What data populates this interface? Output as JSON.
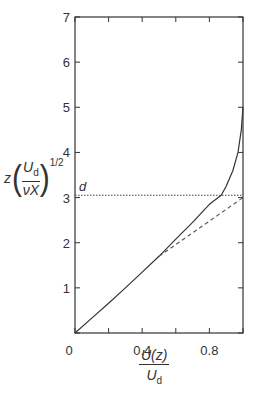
{
  "chart_data": {
    "type": "line",
    "title": "",
    "xlabel": "U(z) / U_d",
    "ylabel": "z (U_d / νX)^(1/2)",
    "xlim": [
      0,
      1.0
    ],
    "ylim": [
      0,
      7
    ],
    "x_ticks": [
      0,
      0.2,
      0.4,
      0.6,
      0.8,
      1.0
    ],
    "x_tick_labels": [
      "0",
      "",
      "0.4",
      "",
      "0.8",
      ""
    ],
    "y_ticks": [
      0,
      1,
      2,
      3,
      4,
      5,
      6,
      7
    ],
    "y_tick_labels": [
      "",
      "1",
      "2",
      "3",
      "4",
      "5",
      "6",
      "7"
    ],
    "grid": false,
    "legend": null,
    "series": [
      {
        "name": "velocity profile",
        "style": "solid",
        "points": [
          [
            0,
            0
          ],
          [
            0.1,
            0.33
          ],
          [
            0.2,
            0.66
          ],
          [
            0.3,
            1.0
          ],
          [
            0.4,
            1.35
          ],
          [
            0.5,
            1.7
          ],
          [
            0.6,
            2.08
          ],
          [
            0.7,
            2.45
          ],
          [
            0.8,
            2.85
          ],
          [
            0.87,
            3.05
          ],
          [
            0.9,
            3.25
          ],
          [
            0.94,
            3.6
          ],
          [
            0.97,
            4.0
          ],
          [
            0.99,
            4.5
          ],
          [
            1.0,
            5.0
          ]
        ]
      },
      {
        "name": "linear tangent extension",
        "style": "dashed",
        "points": [
          [
            0.5,
            1.7
          ],
          [
            1.0,
            3.0
          ]
        ]
      },
      {
        "name": "d (thickness level)",
        "style": "dotted",
        "points": [
          [
            0,
            3.05
          ],
          [
            1.0,
            3.05
          ]
        ]
      }
    ],
    "annotations": [
      {
        "text": "d",
        "x": 0.02,
        "y": 3.2
      }
    ]
  },
  "labels": {
    "y_axis": {
      "z": "z",
      "num": "U",
      "num_sub": "d",
      "den": "νX",
      "exp": "1/2"
    },
    "x_axis": {
      "num": "U(z)",
      "den": "U",
      "den_sub": "d"
    },
    "d_marker": "d"
  },
  "colors": {
    "axis": "#333333",
    "curve": "#333333",
    "dashed": "#555555",
    "dotted": "#444444"
  }
}
